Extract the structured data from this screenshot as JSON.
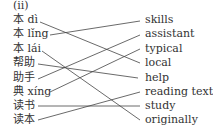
{
  "exercise_label": "(ii)",
  "left_items": [
    "本 dì",
    "本 lǐng",
    "本 lái",
    "帮助",
    "助手",
    "典 xíng",
    "读书",
    "读本"
  ],
  "right_items": [
    "skills",
    "assistant",
    "typical",
    "local",
    "help",
    "reading text",
    "study",
    "originally"
  ],
  "matches": [
    {
      "left": "本 dì",
      "right": "local"
    },
    {
      "left": "本 lǐng",
      "right": "skills"
    },
    {
      "left": "本 lái",
      "right": "originally"
    },
    {
      "left": "帮助",
      "right": "help"
    },
    {
      "left": "助手",
      "right": "assistant"
    },
    {
      "left": "典 xíng",
      "right": "typical"
    },
    {
      "left": "读书",
      "right": "study"
    },
    {
      "left": "读本",
      "right": "reading text"
    }
  ]
}
